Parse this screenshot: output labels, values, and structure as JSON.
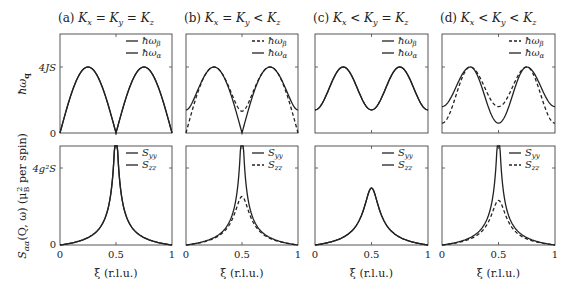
{
  "chart_data": [
    {
      "type": "line",
      "panel": "a-top",
      "title": "(a)  K_x = K_y = K_z",
      "ylabel": "ħω_q",
      "ytick_labels": [
        "0",
        "4JS"
      ],
      "xlim": [
        0,
        1
      ],
      "legend": [
        {
          "name": "ħω_β",
          "style": "solid"
        },
        {
          "name": "ħω_α",
          "style": "solid"
        }
      ],
      "series": [
        {
          "name": "ħω_β",
          "x": [
            0,
            0.125,
            0.25,
            0.375,
            0.5,
            0.625,
            0.75,
            0.875,
            1
          ],
          "values": [
            0,
            0.71,
            1.0,
            0.71,
            0,
            0.71,
            1.0,
            0.71,
            0
          ]
        },
        {
          "name": "ħω_α",
          "x": [
            0,
            0.125,
            0.25,
            0.375,
            0.5,
            0.625,
            0.75,
            0.875,
            1
          ],
          "values": [
            0,
            0.71,
            1.0,
            0.71,
            0,
            0.71,
            1.0,
            0.71,
            0
          ]
        }
      ]
    },
    {
      "type": "line",
      "panel": "b-top",
      "title": "(b)  K_x = K_y < K_z",
      "legend": [
        {
          "name": "ħω_β",
          "style": "dashed"
        },
        {
          "name": "ħω_α",
          "style": "solid"
        }
      ],
      "series": [
        {
          "name": "ħω_β",
          "x": [
            0,
            0.125,
            0.25,
            0.375,
            0.5,
            0.625,
            0.75,
            0.875,
            1
          ],
          "values": [
            0,
            0.68,
            1.0,
            0.72,
            0.35,
            0.72,
            1.0,
            0.68,
            0
          ]
        },
        {
          "name": "ħω_α",
          "x": [
            0,
            0.125,
            0.25,
            0.375,
            0.5,
            0.625,
            0.75,
            0.875,
            1
          ],
          "values": [
            0.35,
            0.72,
            1.0,
            0.68,
            0,
            0.68,
            1.0,
            0.72,
            0.35
          ]
        }
      ]
    },
    {
      "type": "line",
      "panel": "c-top",
      "title": "(c)  K_x < K_y = K_z",
      "legend": [
        {
          "name": "ħω_β",
          "style": "solid"
        },
        {
          "name": "ħω_α",
          "style": "solid"
        }
      ],
      "series": [
        {
          "name": "ħω_β",
          "x": [
            0,
            0.125,
            0.25,
            0.375,
            0.5,
            0.625,
            0.75,
            0.875,
            1
          ],
          "values": [
            0.35,
            0.78,
            1.0,
            0.78,
            0.35,
            0.78,
            1.0,
            0.78,
            0.35
          ]
        },
        {
          "name": "ħω_α",
          "x": [
            0,
            0.125,
            0.25,
            0.375,
            0.5,
            0.625,
            0.75,
            0.875,
            1
          ],
          "values": [
            0.35,
            0.78,
            1.0,
            0.78,
            0.35,
            0.78,
            1.0,
            0.78,
            0.35
          ]
        }
      ]
    },
    {
      "type": "line",
      "panel": "d-top",
      "title": "(d)  K_x < K_y < K_z",
      "legend": [
        {
          "name": "ħω_β",
          "style": "dashed"
        },
        {
          "name": "ħω_α",
          "style": "solid"
        }
      ],
      "series": [
        {
          "name": "ħω_β",
          "x": [
            0,
            0.125,
            0.25,
            0.375,
            0.5,
            0.625,
            0.75,
            0.875,
            1
          ],
          "values": [
            0.15,
            0.72,
            1.0,
            0.76,
            0.4,
            0.76,
            1.0,
            0.72,
            0.15
          ]
        },
        {
          "name": "ħω_α",
          "x": [
            0,
            0.125,
            0.25,
            0.375,
            0.5,
            0.625,
            0.75,
            0.875,
            1
          ],
          "values": [
            0.4,
            0.76,
            1.0,
            0.72,
            0.15,
            0.72,
            1.0,
            0.76,
            0.4
          ]
        }
      ]
    },
    {
      "type": "line",
      "panel": "a-bottom",
      "xlabel": "ξ (r.l.u.)",
      "ylabel": "S_αα(Q,ω) (μ_B² per spin)",
      "ytick_labels": [
        "0",
        "4g²S"
      ],
      "xtick_labels": [
        "0",
        "0.5",
        "1"
      ],
      "legend": [
        {
          "name": "S_yy",
          "style": "solid"
        },
        {
          "name": "S_zz",
          "style": "solid"
        }
      ],
      "series": [
        {
          "name": "S_yy",
          "x": [
            0,
            0.1,
            0.2,
            0.3,
            0.4,
            0.45,
            0.48,
            0.52,
            0.55,
            0.6,
            0.7,
            0.8,
            0.9,
            1
          ],
          "values": [
            0,
            0.06,
            0.13,
            0.22,
            0.4,
            0.65,
            1.3,
            1.3,
            0.65,
            0.4,
            0.22,
            0.13,
            0.06,
            0
          ]
        },
        {
          "name": "S_zz",
          "x": [
            0,
            0.1,
            0.2,
            0.3,
            0.4,
            0.45,
            0.48,
            0.52,
            0.55,
            0.6,
            0.7,
            0.8,
            0.9,
            1
          ],
          "values": [
            0,
            0.06,
            0.13,
            0.22,
            0.4,
            0.65,
            1.3,
            1.3,
            0.65,
            0.4,
            0.22,
            0.13,
            0.06,
            0
          ]
        }
      ]
    },
    {
      "type": "line",
      "panel": "b-bottom",
      "xlabel": "ξ (r.l.u.)",
      "xtick_labels": [
        "0",
        "0.5",
        "1"
      ],
      "legend": [
        {
          "name": "S_yy",
          "style": "solid"
        },
        {
          "name": "S_zz",
          "style": "dashed"
        }
      ],
      "series": [
        {
          "name": "S_yy",
          "x": [
            0,
            0.1,
            0.2,
            0.3,
            0.4,
            0.45,
            0.48,
            0.52,
            0.55,
            0.6,
            0.7,
            0.8,
            0.9,
            1
          ],
          "values": [
            0,
            0.06,
            0.13,
            0.22,
            0.4,
            0.65,
            1.3,
            1.3,
            0.65,
            0.4,
            0.22,
            0.13,
            0.06,
            0
          ]
        },
        {
          "name": "S_zz",
          "x": [
            0,
            0.1,
            0.2,
            0.3,
            0.4,
            0.45,
            0.5,
            0.55,
            0.6,
            0.7,
            0.8,
            0.9,
            1
          ],
          "values": [
            0,
            0.06,
            0.13,
            0.21,
            0.34,
            0.5,
            0.62,
            0.5,
            0.34,
            0.21,
            0.13,
            0.06,
            0
          ]
        }
      ]
    },
    {
      "type": "line",
      "panel": "c-bottom",
      "xlabel": "ξ (r.l.u.)",
      "xtick_labels": [
        "0",
        "0.5",
        "1"
      ],
      "legend": [
        {
          "name": "S_yy",
          "style": "solid"
        },
        {
          "name": "S_zz",
          "style": "solid"
        }
      ],
      "series": [
        {
          "name": "S_yy",
          "x": [
            0,
            0.1,
            0.2,
            0.3,
            0.4,
            0.45,
            0.5,
            0.55,
            0.6,
            0.7,
            0.8,
            0.9,
            1
          ],
          "values": [
            0,
            0.05,
            0.12,
            0.2,
            0.36,
            0.55,
            0.74,
            0.55,
            0.36,
            0.2,
            0.12,
            0.05,
            0
          ]
        },
        {
          "name": "S_zz",
          "x": [
            0,
            0.1,
            0.2,
            0.3,
            0.4,
            0.45,
            0.5,
            0.55,
            0.6,
            0.7,
            0.8,
            0.9,
            1
          ],
          "values": [
            0,
            0.05,
            0.12,
            0.2,
            0.36,
            0.55,
            0.74,
            0.55,
            0.36,
            0.2,
            0.12,
            0.05,
            0
          ]
        }
      ]
    },
    {
      "type": "line",
      "panel": "d-bottom",
      "xlabel": "ξ (r.l.u.)",
      "xtick_labels": [
        "0",
        "0.5",
        "1"
      ],
      "legend": [
        {
          "name": "S_yy",
          "style": "solid"
        },
        {
          "name": "S_zz",
          "style": "dashed"
        }
      ],
      "series": [
        {
          "name": "S_yy",
          "x": [
            0,
            0.1,
            0.2,
            0.3,
            0.4,
            0.45,
            0.48,
            0.52,
            0.55,
            0.6,
            0.7,
            0.8,
            0.9,
            1
          ],
          "values": [
            0,
            0.06,
            0.13,
            0.22,
            0.4,
            0.65,
            1.3,
            1.3,
            0.65,
            0.4,
            0.22,
            0.13,
            0.06,
            0
          ]
        },
        {
          "name": "S_zz",
          "x": [
            0,
            0.1,
            0.2,
            0.3,
            0.4,
            0.45,
            0.5,
            0.55,
            0.6,
            0.7,
            0.8,
            0.9,
            1
          ],
          "values": [
            0,
            0.06,
            0.13,
            0.21,
            0.33,
            0.47,
            0.58,
            0.47,
            0.33,
            0.21,
            0.13,
            0.06,
            0
          ]
        }
      ]
    }
  ],
  "figure": {
    "titles": [
      "(a)  K",
      "(b)  K",
      "(c)  K",
      "(d)  K"
    ],
    "title_texts": {
      "a": [
        "(a)",
        "K",
        "x",
        "=",
        "K",
        "y",
        "=",
        "K",
        "z"
      ],
      "b": [
        "(b)",
        "K",
        "x",
        "=",
        "K",
        "y",
        "<",
        "K",
        "z"
      ],
      "c": [
        "(c)",
        "K",
        "x",
        "<",
        "K",
        "y",
        "=",
        "K",
        "z"
      ],
      "d": [
        "(d)",
        "K",
        "x",
        "<",
        "K",
        "y",
        "<",
        "K",
        "z"
      ]
    },
    "top_ylabel": {
      "main": "ħω",
      "sub": "q"
    },
    "top_ytick_4": "4JS",
    "top_ytick_0": "0",
    "bottom_ylabel": {
      "main": "S",
      "sub": "αα",
      "rest": "(Q, ω) (μ",
      "sub2": "B",
      "sup2": "2",
      "tail": " per spin)"
    },
    "bottom_ytick_top": "4g²S",
    "bottom_ytick_0": "0",
    "xticks": [
      "0",
      "0.5",
      "1"
    ],
    "xlabel": "ξ (r.l.u.)",
    "legend_top": {
      "beta": "ħω",
      "beta_sub": "β",
      "alpha": "ħω",
      "alpha_sub": "α"
    },
    "legend_bottom": {
      "yy": "S",
      "yy_sub": "yy",
      "zz": "S",
      "zz_sub": "zz"
    },
    "line_color": "#222222"
  }
}
